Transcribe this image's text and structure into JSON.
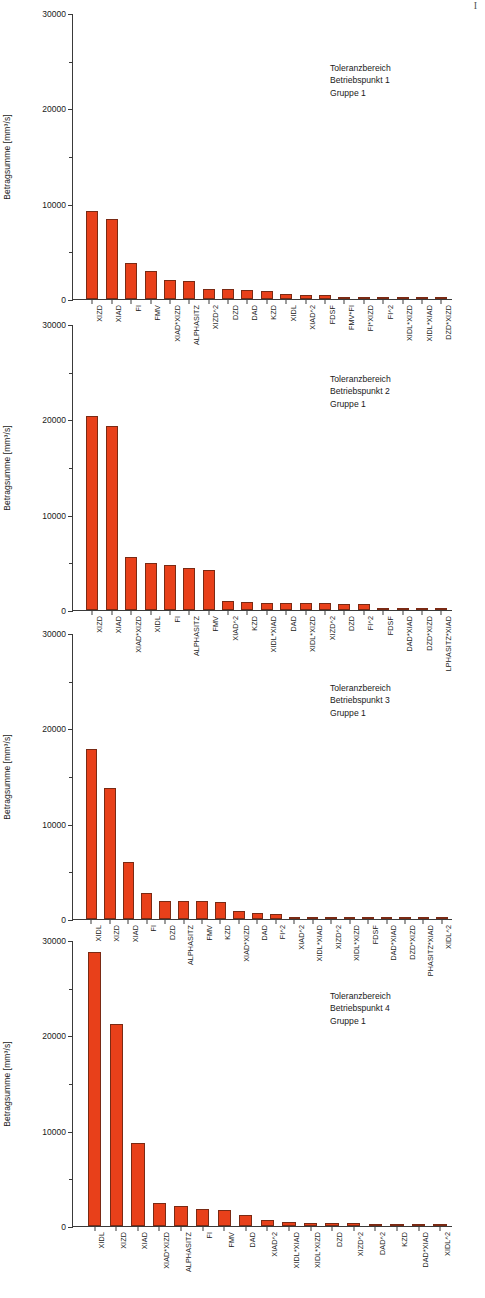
{
  "page": {
    "corner_mark": "I",
    "background_color": "#ffffff",
    "bar_color": "#E8401A",
    "bar_edge_color": "#7a2a14",
    "axis_color": "#3a3a3a"
  },
  "chart_data": [
    {
      "type": "bar",
      "title": "",
      "xlabel": "",
      "ylabel": "Betragsumme [mm³/s]",
      "ylim": [
        0,
        30000
      ],
      "yticks": [
        0,
        10000,
        20000,
        30000
      ],
      "ytick_labels": [
        "0",
        "10000",
        "20000",
        "30000"
      ],
      "grid": false,
      "annotation": [
        "Toleranzbereich",
        "Betriebspunkt 1",
        "Gruppe 1"
      ],
      "categories": [
        "XIZD",
        "XIAD",
        "FI",
        "FMV",
        "XIAD*XIZD",
        "ALPHASITZ",
        "XIZD^2",
        "DZD",
        "DAD",
        "KZD",
        "XIDL",
        "XIAD^2",
        "FDSF",
        "FMV*FI",
        "FI*XIZD",
        "FI^2",
        "XIDL*XIZD",
        "XIDL*XIAD",
        "DZD*XIZD"
      ],
      "values": [
        9250,
        8400,
        3800,
        2950,
        2000,
        1850,
        1050,
        1000,
        950,
        850,
        500,
        420,
        400,
        220,
        160,
        90,
        50,
        35,
        25
      ]
    },
    {
      "type": "bar",
      "title": "",
      "xlabel": "",
      "ylabel": "Betragsumme [mm³/s]",
      "ylim": [
        0,
        30000
      ],
      "yticks": [
        0,
        10000,
        20000,
        30000
      ],
      "ytick_labels": [
        "0",
        "10000",
        "20000",
        "30000"
      ],
      "grid": false,
      "annotation": [
        "Toleranzbereich",
        "Betriebspunkt 2",
        "Gruppe 1"
      ],
      "categories": [
        "XIZD",
        "XIAD",
        "XIAD*XIZD",
        "XIDL",
        "FI",
        "ALPHASITZ",
        "FMV",
        "XIAD^2",
        "KZD",
        "XIDL*XIAD",
        "DAD",
        "XIDL*XIZD",
        "XIZD^2",
        "DZD",
        "FI^2",
        "FDSF",
        "DAD*XIAD",
        "DZD*XIZD",
        "LPHASITZ*XIAD"
      ],
      "values": [
        20300,
        19300,
        5600,
        4900,
        4700,
        4400,
        4200,
        900,
        800,
        780,
        760,
        720,
        700,
        650,
        600,
        120,
        90,
        60,
        40
      ]
    },
    {
      "type": "bar",
      "title": "",
      "xlabel": "",
      "ylabel": "Betragsumme [mm³/s]",
      "ylim": [
        0,
        30000
      ],
      "yticks": [
        0,
        10000,
        20000,
        30000
      ],
      "ytick_labels": [
        "0",
        "10000",
        "20000",
        "30000"
      ],
      "grid": false,
      "annotation": [
        "Toleranzbereich",
        "Betriebspunkt 3",
        "Gruppe 1"
      ],
      "categories": [
        "XIDL",
        "XIZD",
        "XIAD",
        "FI",
        "DZD",
        "ALPHASITZ",
        "FMV",
        "KZD",
        "XIAD*XIZD",
        "DAD",
        "FI^2",
        "XIAD^2",
        "XIDL*XIAD",
        "XIZD^2",
        "XIDL*XIZD",
        "FDSF",
        "DAD*XIAD",
        "DZD*XIZD",
        "PHASITZ*XIAD",
        "XIDL^2"
      ],
      "values": [
        17800,
        13700,
        6000,
        2700,
        1900,
        1900,
        1900,
        1800,
        820,
        600,
        560,
        260,
        220,
        200,
        170,
        60,
        50,
        45,
        35,
        25
      ]
    },
    {
      "type": "bar",
      "title": "",
      "xlabel": "",
      "ylabel": "Betragsumme [mm³/s]",
      "ylim": [
        0,
        30000
      ],
      "yticks": [
        0,
        10000,
        20000,
        30000
      ],
      "ytick_labels": [
        "0",
        "10000",
        "20000",
        "30000"
      ],
      "grid": false,
      "annotation": [
        "Toleranzbereich",
        "Betriebspunkt 4",
        "Gruppe 1"
      ],
      "categories": [
        "XIDL",
        "XIZD",
        "XIAD",
        "XIAD*XIZD",
        "ALPHASITZ",
        "FI",
        "FMV",
        "DAD",
        "XIAD^2",
        "XIDL*XIAD",
        "XIDL*XIZD",
        "DZD",
        "XIZD^2",
        "DAD^2",
        "KZD",
        "DAD*XIAD",
        "XIDL^2"
      ],
      "values": [
        28700,
        21200,
        8700,
        2400,
        2100,
        1800,
        1700,
        1200,
        600,
        420,
        330,
        300,
        270,
        230,
        180,
        110,
        70
      ]
    }
  ]
}
